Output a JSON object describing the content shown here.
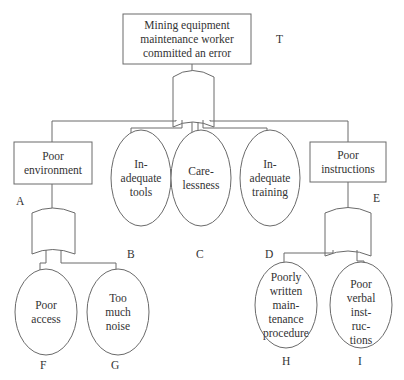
{
  "diagram": {
    "type": "fault_tree",
    "top_event": {
      "id": "T",
      "text": "Mining equipment\nmaintenance worker\ncommitted an error",
      "gate": "OR"
    },
    "intermediate_events": [
      {
        "id": "A",
        "text": "Poor\nenvironment",
        "gate": "OR",
        "children": [
          "F",
          "G"
        ]
      },
      {
        "id": "E",
        "text": "Poor\ninstructions",
        "gate": "OR",
        "children": [
          "H",
          "I"
        ]
      }
    ],
    "basic_events": [
      {
        "id": "B",
        "text": "In-\nadequate\ntools"
      },
      {
        "id": "C",
        "text": "Care-\nlessness"
      },
      {
        "id": "D",
        "text": "In-\nadequate\ntraining"
      },
      {
        "id": "F",
        "text": "Poor\naccess"
      },
      {
        "id": "G",
        "text": "Too\nmuch\nnoise"
      },
      {
        "id": "H",
        "text": "Poorly\nwritten\nmain-\ntenance\nprocedure"
      },
      {
        "id": "I",
        "text": "Poor\nverbal\ninst-\nruc-\ntions"
      }
    ],
    "top_gate_inputs": [
      "A",
      "B",
      "C",
      "D",
      "E"
    ],
    "colors": {
      "line": "#6a6a6a",
      "text": "#333333",
      "background": "#ffffff"
    }
  }
}
